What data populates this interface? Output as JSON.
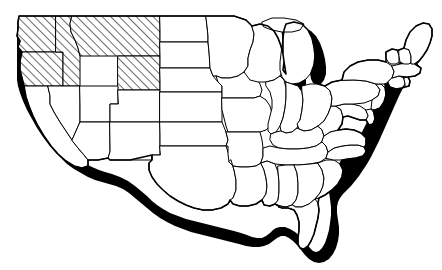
{
  "figure": {
    "kind": "choropleth-outline-map",
    "title": "",
    "caption": "",
    "background_color": "#ffffff",
    "width": 442,
    "height": 270
  },
  "style": {
    "fill_color": "#ffffff",
    "border_color": "#000000",
    "shadow_color": "#000000",
    "lake_color": "#000000",
    "hatch_color": "#000000",
    "hatch_angle_degrees": 45,
    "hatch_spacing_px": 6,
    "state_border_width_px": 1,
    "outer_border_width_px": 1.6,
    "shadow_offset_x_px": 5,
    "shadow_offset_y_px": 6
  },
  "legend": {
    "visible": false,
    "entries": [
      {
        "pattern": "diagonal-hatch",
        "label": "",
        "color": "#000000"
      },
      {
        "pattern": "solid-fill",
        "label": "",
        "color": "#ffffff"
      }
    ]
  },
  "labels": {
    "visible": false,
    "items": []
  },
  "highlight": {
    "pattern": "diagonal-hatch",
    "region_name": "Pacific Northwest and Northern Rockies",
    "count": 5,
    "states": [
      "Washington",
      "Oregon",
      "Idaho",
      "Montana",
      "Wyoming"
    ]
  },
  "shadow": {
    "description": "drop shadow along outer coastlines and borders",
    "edges": [
      "Pacific coast",
      "Mexican border",
      "Gulf coast",
      "Atlantic coast",
      "Great Lakes"
    ]
  },
  "states": [
    {
      "id": "WA",
      "name": "Washington",
      "hatched": true
    },
    {
      "id": "OR",
      "name": "Oregon",
      "hatched": true
    },
    {
      "id": "ID",
      "name": "Idaho",
      "hatched": true
    },
    {
      "id": "MT",
      "name": "Montana",
      "hatched": true
    },
    {
      "id": "WY",
      "name": "Wyoming",
      "hatched": true
    },
    {
      "id": "CA",
      "name": "California",
      "hatched": false
    },
    {
      "id": "NV",
      "name": "Nevada",
      "hatched": false
    },
    {
      "id": "UT",
      "name": "Utah",
      "hatched": false
    },
    {
      "id": "AZ",
      "name": "Arizona",
      "hatched": false
    },
    {
      "id": "CO",
      "name": "Colorado",
      "hatched": false
    },
    {
      "id": "NM",
      "name": "New Mexico",
      "hatched": false
    },
    {
      "id": "ND",
      "name": "North Dakota",
      "hatched": false
    },
    {
      "id": "SD",
      "name": "South Dakota",
      "hatched": false
    },
    {
      "id": "NE",
      "name": "Nebraska",
      "hatched": false
    },
    {
      "id": "KS",
      "name": "Kansas",
      "hatched": false
    },
    {
      "id": "OK",
      "name": "Oklahoma",
      "hatched": false
    },
    {
      "id": "TX",
      "name": "Texas",
      "hatched": false
    },
    {
      "id": "MN",
      "name": "Minnesota",
      "hatched": false
    },
    {
      "id": "IA",
      "name": "Iowa",
      "hatched": false
    },
    {
      "id": "MO",
      "name": "Missouri",
      "hatched": false
    },
    {
      "id": "AR",
      "name": "Arkansas",
      "hatched": false
    },
    {
      "id": "LA",
      "name": "Louisiana",
      "hatched": false
    },
    {
      "id": "WI",
      "name": "Wisconsin",
      "hatched": false
    },
    {
      "id": "IL",
      "name": "Illinois",
      "hatched": false
    },
    {
      "id": "MI",
      "name": "Michigan",
      "hatched": false
    },
    {
      "id": "IN",
      "name": "Indiana",
      "hatched": false
    },
    {
      "id": "OH",
      "name": "Ohio",
      "hatched": false
    },
    {
      "id": "KY",
      "name": "Kentucky",
      "hatched": false
    },
    {
      "id": "TN",
      "name": "Tennessee",
      "hatched": false
    },
    {
      "id": "MS",
      "name": "Mississippi",
      "hatched": false
    },
    {
      "id": "AL",
      "name": "Alabama",
      "hatched": false
    },
    {
      "id": "GA",
      "name": "Georgia",
      "hatched": false
    },
    {
      "id": "FL",
      "name": "Florida",
      "hatched": false
    },
    {
      "id": "SC",
      "name": "South Carolina",
      "hatched": false
    },
    {
      "id": "NC",
      "name": "North Carolina",
      "hatched": false
    },
    {
      "id": "VA",
      "name": "Virginia",
      "hatched": false
    },
    {
      "id": "WV",
      "name": "West Virginia",
      "hatched": false
    },
    {
      "id": "MD",
      "name": "Maryland",
      "hatched": false
    },
    {
      "id": "DE",
      "name": "Delaware",
      "hatched": false
    },
    {
      "id": "PA",
      "name": "Pennsylvania",
      "hatched": false
    },
    {
      "id": "NJ",
      "name": "New Jersey",
      "hatched": false
    },
    {
      "id": "NY",
      "name": "New York",
      "hatched": false
    },
    {
      "id": "CT",
      "name": "Connecticut",
      "hatched": false
    },
    {
      "id": "RI",
      "name": "Rhode Island",
      "hatched": false
    },
    {
      "id": "MA",
      "name": "Massachusetts",
      "hatched": false
    },
    {
      "id": "VT",
      "name": "Vermont",
      "hatched": false
    },
    {
      "id": "NH",
      "name": "New Hampshire",
      "hatched": false
    },
    {
      "id": "ME",
      "name": "Maine",
      "hatched": false
    }
  ]
}
